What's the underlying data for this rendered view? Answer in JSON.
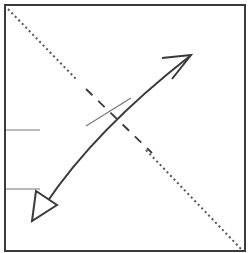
{
  "diagram": {
    "type": "origami-fold-instruction",
    "colors": {
      "stroke": "#3a3a3a",
      "fold_line": "#555555",
      "crease": "#777777",
      "background": "#ffffff"
    },
    "elements": [
      "paper-square",
      "valley-fold-diagonal-dotted",
      "dashed-center-segment",
      "crease-mark",
      "fold-arrow-curved-double-headed",
      "left-edge-reference-marks"
    ]
  }
}
